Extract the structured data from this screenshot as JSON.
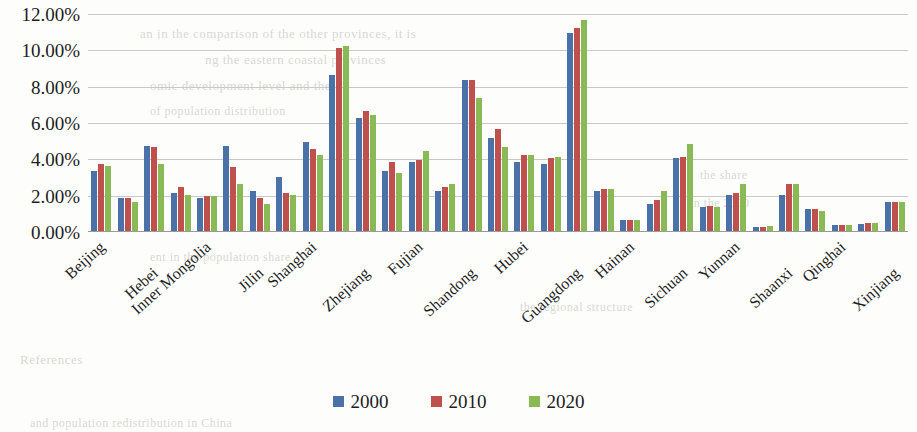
{
  "chart_data": {
    "type": "bar",
    "title": "",
    "xlabel": "",
    "ylabel": "",
    "ylim": [
      0,
      12
    ],
    "ytick_labels": [
      "12.00%",
      "10.00%",
      "8.00%",
      "6.00%",
      "4.00%",
      "2.00%",
      "0.00%"
    ],
    "ytick_values": [
      12,
      10,
      8,
      6,
      4,
      2,
      0
    ],
    "grid": true,
    "legend_position": "bottom",
    "value_unit": "percent",
    "categories": [
      "Beijing",
      "Tianjin",
      "Hebei",
      "Shanxi",
      "Inner Mongolia",
      "Liaoning",
      "Jilin",
      "Heilongjiang",
      "Shanghai",
      "Jiangsu",
      "Zhejiang",
      "Anhui",
      "Fujian",
      "Jiangxi",
      "Shandong",
      "Henan",
      "Hubei",
      "Hunan",
      "Guangdong",
      "Guangxi",
      "Hainan",
      "Chongqing",
      "Sichuan",
      "Guizhou",
      "Yunnan",
      "Tibet",
      "Shaanxi",
      "Gansu",
      "Qinghai",
      "Ningxia",
      "Xinjiang"
    ],
    "visible_tick_labels": [
      "Beijing",
      "Hebei",
      "Inner Mongolia",
      "Jilin",
      "Shanghai",
      "Zhejiang",
      "Fujian",
      "Shandong",
      "Hubei",
      "Guangdong",
      "Hainan",
      "Sichuan",
      "Yunnan",
      "Shaanxi",
      "Qinghai",
      "Xinjiang"
    ],
    "series": [
      {
        "name": "2000",
        "color": "#4a72a8",
        "values": [
          3.3,
          1.8,
          4.7,
          2.1,
          1.8,
          4.7,
          2.2,
          3.0,
          4.9,
          8.6,
          6.2,
          3.3,
          3.8,
          2.2,
          8.3,
          5.1,
          3.8,
          3.7,
          10.9,
          2.2,
          0.6,
          1.5,
          4.0,
          1.3,
          2.0,
          0.2,
          2.0,
          1.2,
          0.35,
          0.4,
          1.6
        ]
      },
      {
        "name": "2010",
        "color": "#c0504d",
        "values": [
          3.7,
          1.8,
          4.6,
          2.4,
          1.9,
          3.5,
          1.8,
          2.1,
          4.5,
          10.1,
          6.6,
          3.8,
          3.9,
          2.4,
          8.3,
          5.6,
          4.2,
          4.0,
          11.2,
          2.3,
          0.6,
          1.7,
          4.1,
          1.4,
          2.1,
          0.2,
          2.6,
          1.2,
          0.35,
          0.45,
          1.6
        ]
      },
      {
        "name": "2020",
        "color": "#8aba55",
        "values": [
          3.6,
          1.6,
          3.7,
          2.0,
          1.9,
          2.6,
          1.5,
          2.0,
          4.2,
          10.2,
          6.4,
          3.2,
          4.4,
          2.6,
          7.3,
          4.6,
          4.2,
          4.1,
          11.6,
          2.3,
          0.6,
          2.2,
          4.8,
          1.3,
          2.6,
          0.25,
          2.6,
          1.1,
          0.35,
          0.45,
          1.6
        ]
      }
    ],
    "legend": [
      {
        "label": "2000",
        "color": "#4a72a8"
      },
      {
        "label": "2010",
        "color": "#c0504d"
      },
      {
        "label": "2020",
        "color": "#8aba55"
      }
    ]
  },
  "background_text": {
    "l1": "an in the comparison of the other provinces, it is",
    "l2": "ng the eastern coastal provinces",
    "l3": "omic development level and the",
    "l4": "of population distribution",
    "l5": "ent in the population share",
    "l6": "the regional structure",
    "l7": "References",
    "l8": "and population redistribution in China",
    "l9": "in the 2000",
    "l10": "the share"
  }
}
